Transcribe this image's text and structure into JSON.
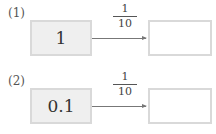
{
  "problems": [
    {
      "label": "(1)",
      "input": "1",
      "operator": {
        "numerator": "1",
        "denominator": "10"
      },
      "answer": ""
    },
    {
      "label": "(2)",
      "input": "0.1",
      "operator": {
        "numerator": "1",
        "denominator": "10"
      },
      "answer": ""
    }
  ]
}
